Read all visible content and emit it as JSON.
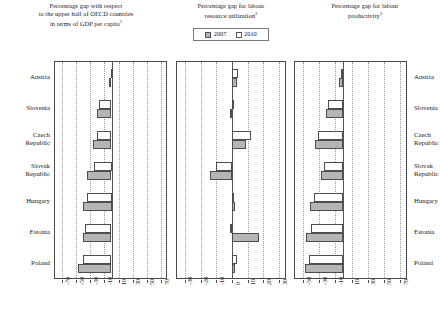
{
  "figure": {
    "countries": [
      "Austria",
      "Slovenia",
      "Czech Republic",
      "Slovak Republic",
      "Hungary",
      "Estonia",
      "Poland"
    ],
    "legend": {
      "items": [
        {
          "label": "2007",
          "style": "filled",
          "color": "#b5b5b5"
        },
        {
          "label": "2010",
          "style": "hollow",
          "color": "#ffffff"
        }
      ]
    }
  },
  "panels": [
    {
      "id": "panel-1",
      "title_lines": [
        "Percentage gap with respect",
        "to the upper half of OECD countries",
        "in terms of GDP per capita"
      ],
      "title_note": "1",
      "ticks": [
        "-70",
        "-50",
        "-30",
        "-10",
        "10",
        "30",
        "50",
        "70"
      ]
    },
    {
      "id": "panel-2",
      "title_lines": [
        "Percentage gap for labour",
        "resource utilization"
      ],
      "title_note": "2",
      "ticks": [
        "-30",
        "-20",
        "-10",
        "0",
        "10",
        "20",
        "30"
      ]
    },
    {
      "id": "panel-3",
      "title_lines": [
        "Percentage gap for labour",
        "productivity"
      ],
      "title_note": "3",
      "ticks": [
        "-50",
        "-30",
        "-10",
        "10",
        "30",
        "50",
        "70"
      ]
    }
  ],
  "chart_data": [
    {
      "type": "bar",
      "orientation": "horizontal",
      "title": "Percentage gap with respect to the upper half of OECD countries in terms of GDP per capita",
      "xlabel": "",
      "ylabel": "",
      "xlim": [
        -80,
        80
      ],
      "xticks": [
        -70,
        -50,
        -30,
        -10,
        10,
        30,
        50,
        70
      ],
      "grid": true,
      "categories": [
        "Austria",
        "Slovenia",
        "Czech Republic",
        "Slovak Republic",
        "Hungary",
        "Estonia",
        "Poland"
      ],
      "series": [
        {
          "name": "2007",
          "values": [
            -4,
            -21,
            -26,
            -34,
            -40,
            -41,
            -47
          ]
        },
        {
          "name": "2010",
          "values": [
            -1,
            -17,
            -21,
            -25,
            -35,
            -38,
            -41
          ]
        }
      ]
    },
    {
      "type": "bar",
      "orientation": "horizontal",
      "title": "Percentage gap for labour resource utilization",
      "xlabel": "",
      "ylabel": "",
      "xlim": [
        -35,
        35
      ],
      "xticks": [
        -30,
        -20,
        -10,
        0,
        10,
        20,
        30
      ],
      "grid": true,
      "categories": [
        "Austria",
        "Slovenia",
        "Czech Republic",
        "Slovak Republic",
        "Hungary",
        "Estonia",
        "Poland"
      ],
      "series": [
        {
          "name": "2007",
          "values": [
            3,
            -1,
            9,
            -14,
            2,
            17,
            2
          ]
        },
        {
          "name": "2010",
          "values": [
            4,
            1,
            12,
            -10,
            1,
            -1,
            3
          ]
        }
      ]
    },
    {
      "type": "bar",
      "orientation": "horizontal",
      "title": "Percentage gap for labour productivity",
      "xlabel": "",
      "ylabel": "",
      "xlim": [
        -60,
        80
      ],
      "xticks": [
        -50,
        -30,
        -10,
        10,
        30,
        50,
        70
      ],
      "grid": true,
      "categories": [
        "Austria",
        "Slovenia",
        "Czech Republic",
        "Slovak Republic",
        "Hungary",
        "Estonia",
        "Poland"
      ],
      "series": [
        {
          "name": "2007",
          "values": [
            -6,
            -22,
            -35,
            -28,
            -42,
            -46,
            -48
          ]
        },
        {
          "name": "2010",
          "values": [
            -3,
            -19,
            -32,
            -24,
            -37,
            -40,
            -43
          ]
        }
      ]
    }
  ]
}
